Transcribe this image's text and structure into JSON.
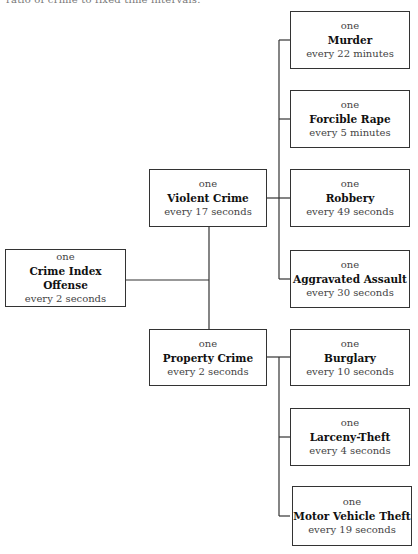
{
  "caption": "ratio of crime to fixed time intervals.",
  "root": {
    "prefix": "one",
    "name": "Crime Index Offense",
    "rate": "every 2 seconds"
  },
  "categories": [
    {
      "prefix": "one",
      "name": "Violent Crime",
      "rate": "every 17 seconds",
      "children": [
        {
          "prefix": "one",
          "name": "Murder",
          "rate": "every 22 minutes"
        },
        {
          "prefix": "one",
          "name": "Forcible Rape",
          "rate": "every 5 minutes"
        },
        {
          "prefix": "one",
          "name": "Robbery",
          "rate": "every 49 seconds"
        },
        {
          "prefix": "one",
          "name": "Aggravated Assault",
          "rate": "every 30 seconds"
        }
      ]
    },
    {
      "prefix": "one",
      "name": "Property Crime",
      "rate": "every 2 seconds",
      "children": [
        {
          "prefix": "one",
          "name": "Burglary",
          "rate": "every 10 seconds"
        },
        {
          "prefix": "one",
          "name": "Larceny-Theft",
          "rate": "every 4 seconds"
        },
        {
          "prefix": "one",
          "name": "Motor Vehicle Theft",
          "rate": "every 19 seconds"
        }
      ]
    }
  ]
}
